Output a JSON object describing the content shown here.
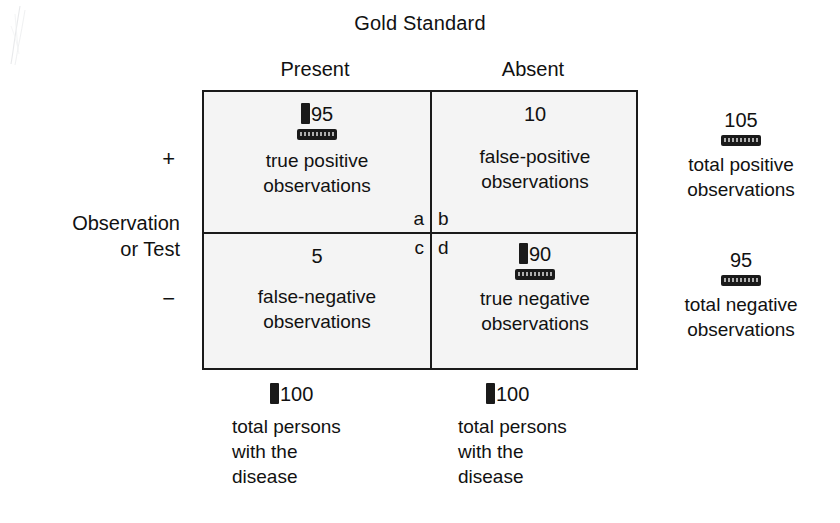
{
  "figure": {
    "title": "Gold Standard",
    "row_axis_label_line1": "Observation",
    "row_axis_label_line2": "or Test",
    "column_headers": [
      "Present",
      "Absent"
    ],
    "row_signs": [
      "+",
      "−"
    ]
  },
  "matrix": {
    "cells": [
      {
        "id": "true-positive",
        "letter": "a",
        "count": "95",
        "desc_line1": "true positive",
        "desc_line2": "observations",
        "has_bar_marker": true,
        "has_redaction_marker": true
      },
      {
        "id": "false-positive",
        "letter": "b",
        "count": "10",
        "desc_line1": "false-positive",
        "desc_line2": "observations",
        "has_bar_marker": false,
        "has_redaction_marker": false
      },
      {
        "id": "false-negative",
        "letter": "c",
        "count": "5",
        "desc_line1": "false-negative",
        "desc_line2": "observations",
        "has_bar_marker": false,
        "has_redaction_marker": false
      },
      {
        "id": "true-negative",
        "letter": "d",
        "count": "90",
        "desc_line1": "true negative",
        "desc_line2": "observations",
        "has_bar_marker": true,
        "has_redaction_marker": true
      }
    ]
  },
  "row_totals": [
    {
      "id": "total-positive",
      "count": "105",
      "desc_line1": "total positive",
      "desc_line2": "observations"
    },
    {
      "id": "total-negative",
      "count": "95",
      "desc_line1": "total negative",
      "desc_line2": "observations"
    }
  ],
  "column_totals": [
    {
      "id": "total-persons-present",
      "count": "100",
      "desc_line1": "total persons",
      "desc_line2": "with the",
      "desc_line3": "disease"
    },
    {
      "id": "total-persons-absent",
      "count": "100",
      "desc_line1": "total persons",
      "desc_line2": "with the",
      "desc_line3": "disease"
    }
  ],
  "colors": {
    "ink": "#1a1a1a",
    "cell_background": "#f4f4f4",
    "page_background": "#ffffff",
    "marker": "#1a1a1a"
  }
}
